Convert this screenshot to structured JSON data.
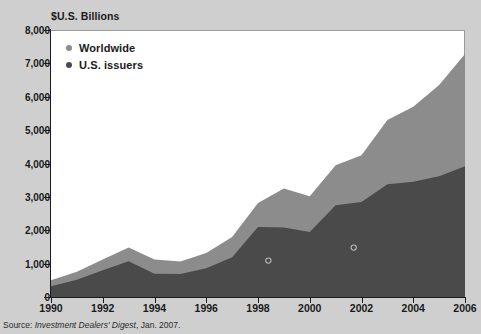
{
  "figure": {
    "background_color": "#cfcfcf",
    "plot_background_color": "#ffffff"
  },
  "axis_title": "$U.S. Billions",
  "legend": {
    "position": "top-left-inside",
    "items": [
      {
        "label": "Worldwide",
        "color": "#8c8c8c",
        "marker": "legend-dot-worldwide"
      },
      {
        "label": "U.S. issuers",
        "color": "#4a4a4a",
        "marker": "legend-dot-us-issuers"
      }
    ]
  },
  "source": {
    "prefix": "Source: ",
    "publication": "Investment Dealers' Digest",
    "suffix": ", Jan. 2007."
  },
  "chart_data": {
    "type": "area",
    "title": "",
    "subtitle": "",
    "xlabel": "",
    "ylabel": "$U.S. Billions",
    "xlim": [
      1990,
      2006
    ],
    "ylim": [
      0,
      8000
    ],
    "grid": false,
    "legend_position": "top-left-inside",
    "x": [
      1990,
      1991,
      1992,
      1993,
      1994,
      1995,
      1996,
      1997,
      1998,
      1999,
      2000,
      2001,
      2002,
      2003,
      2004,
      2005,
      2006
    ],
    "xticks": [
      1990,
      1992,
      1994,
      1996,
      1998,
      2000,
      2002,
      2004,
      2006
    ],
    "xtick_labels": [
      "1990",
      "1992",
      "1994",
      "1996",
      "1998",
      "2000",
      "2002",
      "2004",
      "2006"
    ],
    "yticks": [
      0,
      1000,
      2000,
      3000,
      4000,
      5000,
      6000,
      7000,
      8000
    ],
    "ytick_labels": [
      "0",
      "1,000",
      "2,000",
      "3,000",
      "4,000",
      "5,000",
      "6,000",
      "7,000",
      "8,000"
    ],
    "stacking": "overlaid",
    "series": [
      {
        "name": "Worldwide",
        "color": "#8c8c8c",
        "values": [
          500,
          760,
          1120,
          1480,
          1120,
          1060,
          1320,
          1800,
          2820,
          3250,
          3020,
          3950,
          4250,
          5300,
          5700,
          6350,
          7280
        ]
      },
      {
        "name": "U.S. issuers",
        "color": "#4a4a4a",
        "values": [
          320,
          520,
          800,
          1070,
          700,
          690,
          860,
          1190,
          2100,
          2080,
          1950,
          2750,
          2850,
          3380,
          3450,
          3620,
          3920
        ]
      }
    ],
    "annotations": [
      {
        "name": "marker-1998-us-issuers",
        "x": 1998.4,
        "y": 1090,
        "style": "open-circle"
      },
      {
        "name": "marker-2002-us-issuers",
        "x": 2001.7,
        "y": 1480,
        "style": "open-circle"
      }
    ]
  }
}
